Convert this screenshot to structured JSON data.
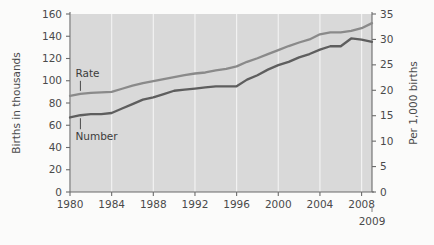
{
  "chart_data": {
    "type": "line",
    "title": "",
    "xlabel": "",
    "ylabel": "Births in thousands",
    "y2label": "Per 1,000 births",
    "grid": true,
    "grid_orientation": "vertical",
    "legend": "inline-annotations",
    "x": [
      1980,
      1981,
      1982,
      1983,
      1984,
      1985,
      1986,
      1987,
      1988,
      1989,
      1990,
      1991,
      1992,
      1993,
      1994,
      1995,
      1996,
      1997,
      1998,
      1999,
      2000,
      2001,
      2002,
      2003,
      2004,
      2005,
      2006,
      2007,
      2008,
      2009
    ],
    "xlim": [
      1980,
      2009
    ],
    "xticks": [
      1980,
      1984,
      1988,
      1992,
      1996,
      2000,
      2004,
      2008
    ],
    "xticklabels": [
      "1980",
      "1984",
      "1988",
      "1992",
      "1996",
      "2000",
      "2004",
      "2008"
    ],
    "end_tick_year": 2009,
    "end_tick_label": "2009",
    "ylim": [
      0,
      160
    ],
    "yticks": [
      0,
      20,
      40,
      60,
      80,
      100,
      120,
      140,
      160
    ],
    "yticklabels": [
      "0",
      "20",
      "40",
      "60",
      "80",
      "100",
      "120",
      "140",
      "160"
    ],
    "y2lim": [
      0,
      35
    ],
    "y2ticks": [
      0,
      5,
      10,
      15,
      20,
      25,
      30,
      35
    ],
    "y2ticklabels": [
      "0",
      "5",
      "10",
      "15",
      "20",
      "25",
      "30",
      "35"
    ],
    "series": [
      {
        "name": "Rate",
        "label": "Rate",
        "axis": "right",
        "units": "per 1,000 births",
        "color": "#8a8a8a",
        "values": [
          18.9,
          19.3,
          19.5,
          19.6,
          19.7,
          20.3,
          20.9,
          21.4,
          21.8,
          22.2,
          22.6,
          23.0,
          23.3,
          23.5,
          23.9,
          24.2,
          24.7,
          25.6,
          26.3,
          27.1,
          27.9,
          28.7,
          29.4,
          30.0,
          31.0,
          31.4,
          31.4,
          31.7,
          32.2,
          33.2
        ]
      },
      {
        "name": "Number",
        "label": "Number",
        "axis": "left",
        "units": "thousands of births",
        "color": "#5e5e5e",
        "values": [
          67,
          69,
          70,
          70,
          71,
          75,
          79,
          83,
          85,
          88,
          91,
          92,
          93,
          94,
          95,
          95,
          95,
          101,
          105,
          110,
          114,
          117,
          121,
          124,
          128,
          131,
          131,
          138,
          137,
          135
        ]
      }
    ],
    "annotations": [
      {
        "text": "Rate",
        "near_year": 1981,
        "placement": "above-line"
      },
      {
        "text": "Number",
        "near_year": 1981,
        "placement": "below-line"
      }
    ],
    "colors": {
      "plot_background": "#d9d9d9",
      "page_background": "#fbfbfa",
      "gridline": "#f2f2f2",
      "axis": "#6b6b6b",
      "text": "#4a4a4a",
      "rate_line": "#8a8a8a",
      "number_line": "#5e5e5e"
    }
  }
}
